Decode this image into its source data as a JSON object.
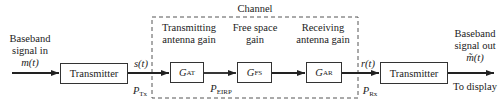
{
  "channel": {
    "title": "Channel"
  },
  "input": {
    "line1": "Baseband",
    "line2": "signal in",
    "symbol": "m(t)"
  },
  "output": {
    "line1": "Baseband",
    "line2": "signal out",
    "symbol": "m̃(t)",
    "note": "To display"
  },
  "blocks": {
    "transmitter": {
      "label": "Transmitter"
    },
    "receiver": {
      "label": "Transmitter"
    },
    "gat": {
      "symbol": "G",
      "sub": "AT",
      "caption1": "Transmitting",
      "caption2": "antenna gain"
    },
    "gfs": {
      "symbol": "G",
      "sub": "FS",
      "caption1": "Free space",
      "caption2": "gain"
    },
    "gar": {
      "symbol": "G",
      "sub": "AR",
      "caption1": "Receiving",
      "caption2": "antenna gain"
    }
  },
  "signals": {
    "s": "s(t)",
    "r": "r(t)",
    "ptx": {
      "symbol": "P",
      "sub": "Tx"
    },
    "peirp": {
      "symbol": "P",
      "sub": "EIRP"
    },
    "prx": {
      "symbol": "P",
      "sub": "Rx"
    }
  },
  "colors": {
    "line": "#222222",
    "dash": "#555555"
  }
}
